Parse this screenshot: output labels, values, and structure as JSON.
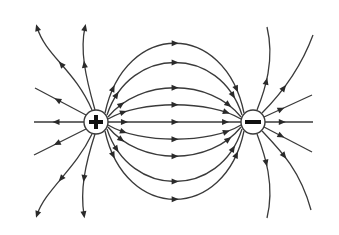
{
  "diagram": {
    "line_color": "#3a3a3a",
    "background": "#ffffff",
    "charges": [
      {
        "name": "positive-charge",
        "sign": "+",
        "cx": 96,
        "cy": 122,
        "r": 12
      },
      {
        "name": "negative-charge",
        "sign": "−",
        "cx": 253,
        "cy": 122,
        "r": 12
      }
    ],
    "connecting_lines": [
      {
        "d": "M105,113 C125,20 225,20 244,113",
        "arrow": [
          175,
          35
        ]
      },
      {
        "d": "M107,115 C130,45 220,45 242,115",
        "arrow": [
          175,
          57
        ]
      },
      {
        "d": "M108,117 C140,78 210,78 241,117",
        "arrow": [
          175,
          86
        ]
      },
      {
        "d": "M108,119 C140,100 210,100 241,119",
        "arrow": [
          175,
          108
        ]
      },
      {
        "d": "M108,122 L241,122",
        "arrow": [
          175,
          122
        ]
      },
      {
        "d": "M108,125 C140,144 210,144 241,125",
        "arrow": [
          175,
          136
        ]
      },
      {
        "d": "M108,127 C140,166 210,166 241,127",
        "arrow": [
          175,
          158
        ]
      },
      {
        "d": "M107,129 C130,199 220,199 242,129",
        "arrow": [
          175,
          186
        ]
      },
      {
        "d": "M105,131 C125,222 225,222 244,131",
        "arrow": [
          175,
          209
        ]
      }
    ],
    "outgoing_lines": [
      {
        "d": "M92,110 C75,70 45,55 37,27",
        "end": [
          37,
          27
        ],
        "dir": "up"
      },
      {
        "d": "M95,110 C85,75 80,50 85,27",
        "end": [
          85,
          27
        ],
        "dir": "up"
      },
      {
        "d": "M86,115 L35,88",
        "end": [
          35,
          88
        ],
        "dir": "none"
      },
      {
        "d": "M84,122 L34,122",
        "end": [
          34,
          122
        ],
        "dir": "left"
      },
      {
        "d": "M86,129 L34,155",
        "end": [
          34,
          155
        ],
        "dir": "none"
      },
      {
        "d": "M92,134 C75,170 45,190 37,215",
        "end": [
          37,
          215
        ],
        "dir": "down"
      },
      {
        "d": "M95,134 C85,165 80,190 84,215",
        "end": [
          84,
          215
        ],
        "dir": "down"
      }
    ],
    "incoming_lines": [
      {
        "d": "M267,27 C275,60 265,90 257,110",
        "start": [
          267,
          27
        ]
      },
      {
        "d": "M313,35 C300,70 280,95 262,113",
        "start": [
          313,
          35
        ]
      },
      {
        "d": "M312,95 L264,117",
        "start": [
          312,
          95
        ]
      },
      {
        "d": "M313,122 L265,122",
        "start": [
          313,
          122
        ]
      },
      {
        "d": "M312,152 L264,127",
        "start": [
          312,
          152
        ]
      },
      {
        "d": "M311,210 C300,170 280,150 262,131",
        "start": [
          311,
          210
        ]
      },
      {
        "d": "M267,218 C275,185 265,155 257,134",
        "start": [
          267,
          218
        ]
      }
    ]
  }
}
